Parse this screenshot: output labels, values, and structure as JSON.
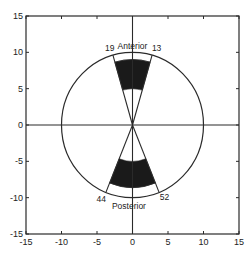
{
  "chart_data": {
    "type": "polar-sector",
    "title": "",
    "xlabel": "",
    "ylabel": "",
    "xlim": [
      -15,
      15
    ],
    "ylim": [
      -15,
      15
    ],
    "xticks": [
      -15,
      -10,
      -5,
      0,
      5,
      10,
      15
    ],
    "yticks": [
      -15,
      -10,
      -5,
      0,
      5,
      10,
      15
    ],
    "grid": false,
    "circle": {
      "cx": 0,
      "cy": 0,
      "r": 10
    },
    "axes_lines": true,
    "sectors": [
      {
        "name": "Anterior",
        "center_angle_deg": 90,
        "half_width_deg": 16,
        "inner_r": 5,
        "outer_r": 9,
        "edge_labels": [
          "19",
          "13"
        ],
        "fill": "#1a1a1a"
      },
      {
        "name": "Posterior",
        "center_angle_deg": 270,
        "half_width_deg": 22,
        "inner_r": 5,
        "outer_r": 8.6,
        "edge_labels": [
          "44",
          "52"
        ],
        "fill": "#1a1a1a"
      }
    ],
    "annotations": [
      {
        "text": "Anterior",
        "x": 0,
        "y": 10.9
      },
      {
        "text": "Posterior",
        "x": -0.5,
        "y": -11.1
      },
      {
        "text": "19",
        "x": -3.2,
        "y": 10.6
      },
      {
        "text": "13",
        "x": 3.4,
        "y": 10.6
      },
      {
        "text": "44",
        "x": -4.4,
        "y": -10.2
      },
      {
        "text": "52",
        "x": 4.5,
        "y": -9.9
      }
    ]
  }
}
